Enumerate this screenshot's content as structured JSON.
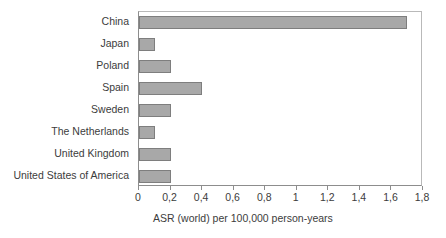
{
  "chart_data": {
    "type": "bar",
    "orientation": "horizontal",
    "title": "",
    "xlabel": "ASR (world) per 100,000 person-years",
    "ylabel": "",
    "categories": [
      "China",
      "Japan",
      "Poland",
      "Spain",
      "Sweden",
      "The Netherlands",
      "United Kingdom",
      "United States of America"
    ],
    "values": [
      1.7,
      0.1,
      0.2,
      0.4,
      0.2,
      0.1,
      0.2,
      0.2
    ],
    "xlim": [
      0,
      1.8
    ],
    "xticks": [
      0,
      0.2,
      0.4,
      0.6,
      0.8,
      1,
      1.2,
      1.4,
      1.6,
      1.8
    ],
    "xtick_labels": [
      "0",
      "0,2",
      "0,4",
      "0,6",
      "0,8",
      "1",
      "1,2",
      "1,4",
      "1,6",
      "1,8"
    ],
    "decimal_separator": ",",
    "grid": false,
    "legend": null,
    "bar_color": "#a8a8a8",
    "bar_border_color": "#7e7e7e",
    "axis_color": "#8d8d8d",
    "text_color": "#3c3c3c",
    "background": "#ffffff"
  }
}
